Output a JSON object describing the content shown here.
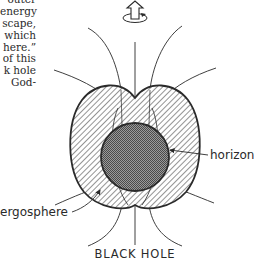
{
  "text_fragment": {
    "lines": [
      "outer",
      "energy",
      "scape,",
      "which",
      "here.”",
      "of this",
      "k hole",
      "God-"
    ]
  },
  "diagram": {
    "title": "BLACK HOLE",
    "labels": {
      "horizon": "horizon",
      "ergosphere": "ergosphere"
    },
    "icons": [
      "rotation-axis-arrow-icon"
    ],
    "colors": {
      "ink": "#2a2a2a",
      "horizon_fill": "#7a7a7a",
      "background": "#ffffff"
    }
  }
}
